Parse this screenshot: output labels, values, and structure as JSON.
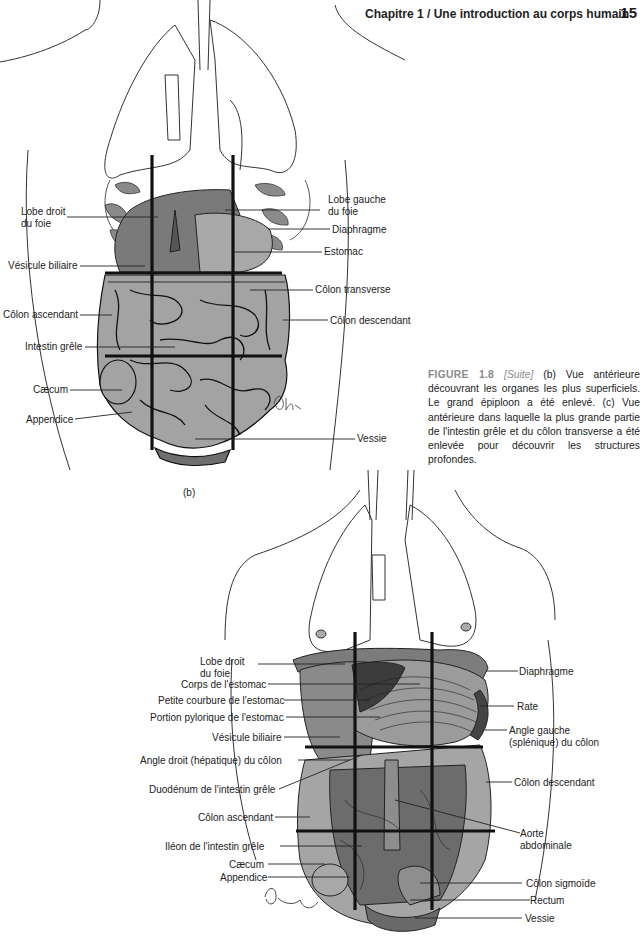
{
  "header": {
    "chapter_title": "Chapitre 1  /  Une introduction au corps humain",
    "page_number": "15"
  },
  "caption": {
    "figure_label": "FIGURE 1.8",
    "bracket_open": " [",
    "suite": "Suite",
    "bracket_close": "] ",
    "text": "(b) Vue antérieure découvrant les organes les plus superficiels. Le grand épiploon a été enlevé. (c) Vue antérieure dans laquelle la plus grande partie de l'intestin grêle et du côlon transverse a été enlevée pour découvrir les structures profondes."
  },
  "figure_b": {
    "sublabel": "(b)",
    "signature": "Dhn.",
    "labels_left": [
      {
        "text": "Lobe droit\ndu foie",
        "line1": "Lobe droit",
        "line2": "du foie"
      },
      {
        "text": "Vésicule biliaire"
      },
      {
        "text": "Côlon ascendant"
      },
      {
        "text": "Intestin grêle"
      },
      {
        "text": "Cæcum"
      },
      {
        "text": "Appendice"
      }
    ],
    "labels_right": [
      {
        "line1": "Lobe gauche",
        "line2": "du foie"
      },
      {
        "text": "Diaphragme"
      },
      {
        "text": "Estomac"
      },
      {
        "text": "Côlon transverse"
      },
      {
        "text": "Côlon descendant"
      },
      {
        "text": "Vessie"
      }
    ]
  },
  "figure_c": {
    "signature": "Dohmann",
    "labels_left": [
      {
        "line1": "Lobe droit",
        "line2": "du foie"
      },
      {
        "text": "Corps de l'estomac"
      },
      {
        "text": "Petite courbure de l'estomac"
      },
      {
        "text": "Portion pylorique de l'estomac"
      },
      {
        "text": "Vésicule biliaire"
      },
      {
        "text": "Angle droit (hépatique) du côlon"
      },
      {
        "text": "Duodénum de l'intestin grêle"
      },
      {
        "text": "Côlon ascendant"
      },
      {
        "text": "Iléon de l'intestin grêle"
      },
      {
        "text": "Cæcum"
      },
      {
        "text": "Appendice"
      }
    ],
    "labels_right": [
      {
        "text": "Diaphragme"
      },
      {
        "text": "Rate"
      },
      {
        "line1": "Angle gauche",
        "line2": "(splénique) du côlon"
      },
      {
        "text": "Côlon descendant"
      },
      {
        "line1": "Aorte",
        "line2": "abdominale"
      },
      {
        "text": "Côlon sigmoïde"
      },
      {
        "text": "Rectum"
      },
      {
        "text": "Vessie"
      }
    ]
  },
  "colors": {
    "organ_gray": "#9a9a9a",
    "organ_dark": "#6e6e6e",
    "line": "#1a1a1a",
    "caption_accent": "#8a8a8a"
  }
}
